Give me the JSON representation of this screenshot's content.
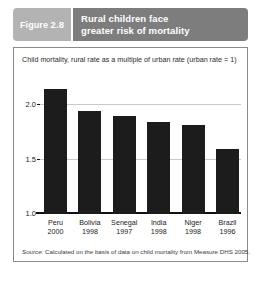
{
  "figure": {
    "label_word": "Figure",
    "label_number": "2.8",
    "title_line_1": "Rural children face",
    "title_line_2": "greater risk of mortality",
    "source_word": "Source:",
    "source_text": " Calculated on the basis of data on child mortality from Measure DHS 2005."
  },
  "colors": {
    "banner_left": "#b3b3b3",
    "banner_right": "#7d7d7d",
    "bar": "#1c1c1c",
    "gridline": "#c9c9c9",
    "frame_border": "#8a8a8a"
  },
  "chart_data": {
    "type": "bar",
    "title": "Rural children face greater risk of mortality",
    "subtitle": "Child mortality, rural rate as a multiple of urban rate (urban rate = 1)",
    "categories": [
      "Peru",
      "Bolivia",
      "Senegal",
      "India",
      "Niger",
      "Brazil"
    ],
    "years": [
      "2000",
      "1998",
      "1997",
      "1998",
      "1998",
      "1996"
    ],
    "values": [
      2.15,
      1.95,
      1.9,
      1.85,
      1.82,
      1.6
    ],
    "xlabel": "",
    "ylabel": "",
    "ylim": [
      1.0,
      2.25
    ],
    "yticks": [
      "1.0",
      "1.5",
      "2.0"
    ],
    "ytick_values": [
      1.0,
      1.5,
      2.0
    ],
    "grid": true,
    "legend": "none"
  }
}
